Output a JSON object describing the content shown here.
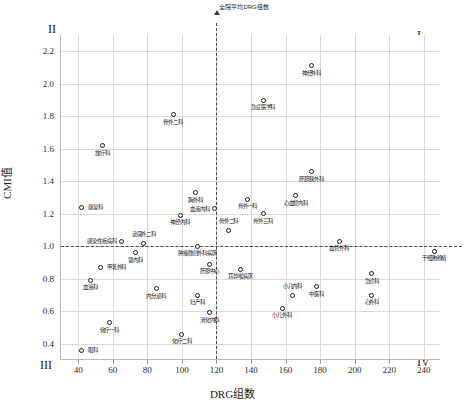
{
  "chart_data": {
    "type": "scatter",
    "title": "",
    "xlabel": "DRG组数",
    "ylabel": "CMI值",
    "xlim": [
      30,
      250
    ],
    "ylim": [
      0.3,
      2.3
    ],
    "xticks": [
      40,
      60,
      80,
      100,
      120,
      140,
      160,
      180,
      200,
      220,
      240
    ],
    "yticks": [
      0.4,
      0.6,
      0.8,
      1.0,
      1.2,
      1.4,
      1.6,
      1.8,
      2.0,
      2.2
    ],
    "grid": true,
    "legend": "none",
    "reference_lines": [
      {
        "axis": "x",
        "value": 120,
        "label": "全院平均DRG组数",
        "style": "dashed"
      },
      {
        "axis": "y",
        "value": 1.0,
        "label": "全院平均CMI值",
        "style": "dashed"
      }
    ],
    "quadrants": [
      {
        "name": "quadrant-2",
        "numeral": "II",
        "position": "top-left"
      },
      {
        "name": "quadrant-1",
        "numeral": "I",
        "position": "top-right"
      },
      {
        "name": "quadrant-3",
        "numeral": "III",
        "position": "bottom-left"
      },
      {
        "name": "quadrant-4",
        "numeral": "IV",
        "position": "bottom-right"
      }
    ],
    "points": [
      {
        "label": "神经外科",
        "x": 175,
        "y": 2.11,
        "pos": "below"
      },
      {
        "label": "急症医学科",
        "x": 147,
        "y": 1.9,
        "pos": "below"
      },
      {
        "label": "骨外二科",
        "x": 95,
        "y": 1.81,
        "pos": "below"
      },
      {
        "label": "放疗科",
        "x": 54,
        "y": 1.62,
        "pos": "below"
      },
      {
        "label": "肝胆胰外科",
        "x": 175,
        "y": 1.46,
        "pos": "below"
      },
      {
        "label": "胸外科",
        "x": 108,
        "y": 1.33,
        "pos": "below"
      },
      {
        "label": "心血管内科",
        "x": 166,
        "y": 1.31,
        "pos": "below"
      },
      {
        "label": "骨外一科",
        "x": 138,
        "y": 1.29,
        "pos": "below"
      },
      {
        "label": "康复科",
        "x": 42,
        "y": 1.24,
        "pos": "right"
      },
      {
        "label": "血液内科",
        "x": 119,
        "y": 1.23,
        "pos": "left"
      },
      {
        "label": "骨外三科",
        "x": 147,
        "y": 1.2,
        "pos": "below"
      },
      {
        "label": "神经内科",
        "x": 99,
        "y": 1.19,
        "pos": "below"
      },
      {
        "label": "骨外二科",
        "x": 127,
        "y": 1.1,
        "pos": "above"
      },
      {
        "label": "感染性疾病科",
        "x": 65,
        "y": 1.03,
        "pos": "left"
      },
      {
        "label": "泌尿外二科",
        "x": 78,
        "y": 1.02,
        "pos": "above"
      },
      {
        "label": "血管外科",
        "x": 191,
        "y": 1.03,
        "pos": "below"
      },
      {
        "label": "肿瘤微创外科病区",
        "x": 109,
        "y": 1.0,
        "pos": "below"
      },
      {
        "label": "干细胞移植",
        "x": 246,
        "y": 0.97,
        "pos": "below"
      },
      {
        "label": "肾内科",
        "x": 73,
        "y": 0.96,
        "pos": "below"
      },
      {
        "label": "肝胆中心",
        "x": 116,
        "y": 0.89,
        "pos": "below"
      },
      {
        "label": "甲乳外科",
        "x": 53,
        "y": 0.87,
        "pos": "right"
      },
      {
        "label": "耳鼻喉病区",
        "x": 134,
        "y": 0.86,
        "pos": "below"
      },
      {
        "label": "急诊科",
        "x": 210,
        "y": 0.83,
        "pos": "below"
      },
      {
        "label": "血液科",
        "x": 47,
        "y": 0.79,
        "pos": "below"
      },
      {
        "label": "中医科",
        "x": 178,
        "y": 0.75,
        "pos": "below"
      },
      {
        "label": "内分泌科",
        "x": 85,
        "y": 0.74,
        "pos": "below"
      },
      {
        "label": "妇产科",
        "x": 109,
        "y": 0.7,
        "pos": "below"
      },
      {
        "label": "小儿内科",
        "x": 164,
        "y": 0.7,
        "pos": "above"
      },
      {
        "label": "心外科",
        "x": 210,
        "y": 0.7,
        "pos": "below"
      },
      {
        "label": "小儿外科",
        "x": 158,
        "y": 0.62,
        "pos": "below"
      },
      {
        "label": "消化内科",
        "x": 116,
        "y": 0.59,
        "pos": "below"
      },
      {
        "label": "化疗一科",
        "x": 58,
        "y": 0.53,
        "pos": "below"
      },
      {
        "label": "化疗二科",
        "x": 100,
        "y": 0.46,
        "pos": "below"
      },
      {
        "label": "眼科",
        "x": 42,
        "y": 0.36,
        "pos": "right"
      }
    ]
  }
}
